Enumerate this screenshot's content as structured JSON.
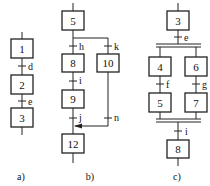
{
  "diagram": {
    "type": "sequential function chart (GRAFCET) examples",
    "colors": {
      "stroke": "#222222",
      "background": "#ffffff"
    },
    "panels": [
      {
        "caption": "a)",
        "kind": "linear sequence",
        "steps": [
          "1",
          "2",
          "3"
        ],
        "transitions": [
          "d",
          "e"
        ]
      },
      {
        "caption": "b)",
        "kind": "selective branch (OR divergence/convergence)",
        "steps": [
          "5",
          "8",
          "9",
          "10",
          "12"
        ],
        "transitions": [
          "h",
          "k",
          "i",
          "j",
          "n"
        ]
      },
      {
        "caption": "c)",
        "kind": "simultaneous branch (AND divergence/convergence)",
        "steps": [
          "3",
          "4",
          "5",
          "6",
          "7",
          "8"
        ],
        "transitions": [
          "e",
          "f",
          "g",
          "i"
        ]
      }
    ]
  }
}
